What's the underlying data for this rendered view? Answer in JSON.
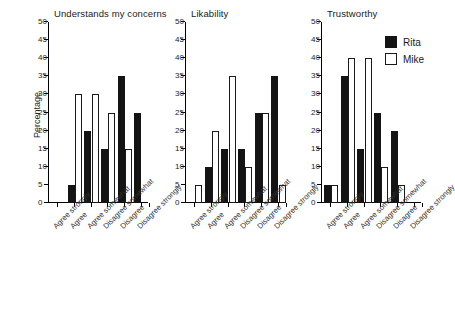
{
  "chart_data": {
    "type": "bar",
    "title": "",
    "xlabel": "",
    "ylabel": "Percentage",
    "ylim": [
      0,
      50
    ],
    "ytick_step": 5,
    "yticks": [
      0,
      5,
      10,
      15,
      20,
      25,
      30,
      35,
      40,
      45,
      50
    ],
    "grid": false,
    "legend_position": "top-right",
    "categories": [
      "Agree strongly",
      "Agree",
      "Agree somewhat",
      "Disagree somewhat",
      "Disagree",
      "Disagree strongly"
    ],
    "series_names": [
      "Rita",
      "Mike"
    ],
    "series_colors": {
      "Rita": "#141414",
      "Mike": "#ffffff"
    },
    "panels": [
      {
        "title": "Understands my concerns",
        "series": [
          {
            "name": "Rita",
            "values": [
              0,
              5,
              20,
              15,
              35,
              25
            ]
          },
          {
            "name": "Mike",
            "values": [
              0,
              30,
              30,
              25,
              15,
              0
            ]
          }
        ]
      },
      {
        "title": "Likability",
        "series": [
          {
            "name": "Rita",
            "values": [
              0,
              10,
              15,
              15,
              25,
              35
            ]
          },
          {
            "name": "Mike",
            "values": [
              5,
              20,
              35,
              10,
              25,
              5
            ]
          }
        ]
      },
      {
        "title": "Trustworthy",
        "series": [
          {
            "name": "Rita",
            "values": [
              5,
              35,
              15,
              25,
              20,
              0
            ]
          },
          {
            "name": "Mike",
            "values": [
              5,
              40,
              40,
              10,
              5,
              0
            ]
          }
        ]
      }
    ]
  },
  "legend": {
    "items": [
      {
        "label": "Rita",
        "style": "filled"
      },
      {
        "label": "Mike",
        "style": "outline"
      }
    ]
  },
  "axis": {
    "ylabel": "Percentage",
    "tick_labels": [
      "0",
      "5",
      "10",
      "15",
      "20",
      "25",
      "30",
      "35",
      "40",
      "45",
      "50"
    ]
  }
}
